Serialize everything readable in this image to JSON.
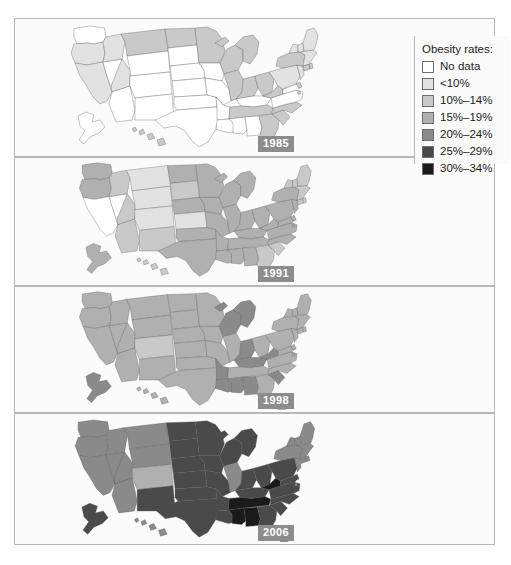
{
  "figure": {
    "kind": "choropleth-map-series"
  },
  "legend": {
    "title": "Obesity rates:",
    "entries": [
      {
        "label": "No data",
        "color": "#ffffff"
      },
      {
        "label": "<10%",
        "color": "#e2e2e2"
      },
      {
        "label": "10%–14%",
        "color": "#c9c9c9"
      },
      {
        "label": "15%–19%",
        "color": "#b0b0b0"
      },
      {
        "label": "20%–24%",
        "color": "#8a8a8a"
      },
      {
        "label": "25%–29%",
        "color": "#4a4a4a"
      },
      {
        "label": "30%–34%",
        "color": "#1a1a1a"
      }
    ]
  },
  "panels": [
    {
      "year": "1985"
    },
    {
      "year": "1991"
    },
    {
      "year": "1998"
    },
    {
      "year": "2006"
    }
  ],
  "chart_data": {
    "type": "heatmap",
    "title": "Obesity rates:",
    "xlabel": "",
    "ylabel": "",
    "legend_position": "right",
    "grid": false,
    "categories": [
      "No data",
      "<10%",
      "10%–14%",
      "15%–19%",
      "20%–24%",
      "25%–29%",
      "30%–34%"
    ],
    "category_colors": [
      "#ffffff",
      "#e2e2e2",
      "#c9c9c9",
      "#b0b0b0",
      "#8a8a8a",
      "#4a4a4a",
      "#1a1a1a"
    ],
    "series": [
      {
        "name": "1985",
        "values": {
          "AL": "No data",
          "AK": "No data",
          "AZ": "No data",
          "AR": "No data",
          "CA": "<10%",
          "CO": "No data",
          "CT": "10%–14%",
          "DE": "10%–14%",
          "DC": "10%–14%",
          "FL": "10%–14%",
          "GA": "10%–14%",
          "HI": "10%–14%",
          "ID": "<10%",
          "IL": "10%–14%",
          "IN": "10%–14%",
          "IA": "No data",
          "KS": "No data",
          "KY": "No data",
          "LA": "No data",
          "ME": "<10%",
          "MD": "No data",
          "MA": "<10%",
          "MI": "10%–14%",
          "MN": "10%–14%",
          "MS": "No data",
          "MO": "No data",
          "MT": "10%–14%",
          "NE": "No data",
          "NV": "No data",
          "NH": "<10%",
          "NJ": "<10%",
          "NM": "No data",
          "NY": "10%–14%",
          "NC": "10%–14%",
          "ND": "10%–14%",
          "OH": "10%–14%",
          "OK": "No data",
          "OR": "<10%",
          "PA": "<10%",
          "RI": "10%–14%",
          "SC": "10%–14%",
          "SD": "No data",
          "TN": "10%–14%",
          "TX": "No data",
          "UT": "<10%",
          "VT": "<10%",
          "VA": "No data",
          "WA": "No data",
          "WV": "10%–14%",
          "WI": "10%–14%",
          "WY": "No data"
        }
      },
      {
        "name": "1991",
        "values": {
          "AL": "15%–19%",
          "AK": "15%–19%",
          "AZ": "10%–14%",
          "AR": "15%–19%",
          "CA": "No data",
          "CO": "<10%",
          "CT": "10%–14%",
          "DE": "15%–19%",
          "DC": "15%–19%",
          "FL": "10%–14%",
          "GA": "10%–14%",
          "HI": "10%–14%",
          "ID": "10%–14%",
          "IL": "15%–19%",
          "IN": "15%–19%",
          "IA": "15%–19%",
          "KS": "<10%",
          "KY": "15%–19%",
          "LA": "15%–19%",
          "ME": "10%–14%",
          "MD": "15%–19%",
          "MA": "10%–14%",
          "MI": "15%–19%",
          "MN": "15%–19%",
          "MS": "15%–19%",
          "MO": "15%–19%",
          "MT": "<10%",
          "NE": "15%–19%",
          "NV": "No data",
          "NH": "10%–14%",
          "NJ": "15%–19%",
          "NM": "10%–14%",
          "NY": "15%–19%",
          "NC": "15%–19%",
          "ND": "15%–19%",
          "OH": "15%–19%",
          "OK": "15%–19%",
          "OR": "15%–19%",
          "PA": "15%–19%",
          "RI": "10%–14%",
          "SC": "10%–14%",
          "SD": "10%–14%",
          "TN": "15%–19%",
          "TX": "15%–19%",
          "UT": "10%–14%",
          "VT": "10%–14%",
          "VA": "15%–19%",
          "WA": "15%–19%",
          "WV": "15%–19%",
          "WI": "15%–19%",
          "WY": "<10%"
        }
      },
      {
        "name": "1998",
        "values": {
          "AL": "20%–24%",
          "AK": "20%–24%",
          "AZ": "15%–19%",
          "AR": "20%–24%",
          "CA": "15%–19%",
          "CO": "10%–14%",
          "CT": "15%–19%",
          "DE": "15%–19%",
          "DC": "15%–19%",
          "FL": "15%–19%",
          "GA": "15%–19%",
          "HI": "15%–19%",
          "ID": "15%–19%",
          "IL": "15%–19%",
          "IN": "20%–24%",
          "IA": "15%–19%",
          "KS": "15%–19%",
          "KY": "20%–24%",
          "LA": "20%–24%",
          "ME": "15%–19%",
          "MD": "15%–19%",
          "MA": "15%–19%",
          "MI": "20%–24%",
          "MN": "15%–19%",
          "MS": "20%–24%",
          "MO": "15%–19%",
          "MT": "15%–19%",
          "NE": "15%–19%",
          "NV": "15%–19%",
          "NH": "15%–19%",
          "NJ": "15%–19%",
          "NM": "15%–19%",
          "NY": "15%–19%",
          "NC": "15%–19%",
          "ND": "15%–19%",
          "OH": "15%–19%",
          "OK": "15%–19%",
          "OR": "15%–19%",
          "PA": "15%–19%",
          "RI": "15%–19%",
          "SC": "20%–24%",
          "SD": "15%–19%",
          "TN": "15%–19%",
          "TX": "15%–19%",
          "UT": "15%–19%",
          "VT": "15%–19%",
          "VA": "15%–19%",
          "WA": "15%–19%",
          "WV": "20%–24%",
          "WI": "20%–24%",
          "WY": "15%–19%"
        }
      },
      {
        "name": "2006",
        "values": {
          "AL": "30%–34%",
          "AK": "25%–29%",
          "AZ": "20%–24%",
          "AR": "25%–29%",
          "CA": "20%–24%",
          "CO": "15%–19%",
          "CT": "20%–24%",
          "DE": "25%–29%",
          "DC": "20%–24%",
          "FL": "20%–24%",
          "GA": "25%–29%",
          "HI": "20%–24%",
          "ID": "20%–24%",
          "IL": "20%–24%",
          "IN": "25%–29%",
          "IA": "25%–29%",
          "KS": "25%–29%",
          "KY": "25%–29%",
          "LA": "25%–29%",
          "ME": "20%–24%",
          "MD": "25%–29%",
          "MA": "20%–24%",
          "MI": "25%–29%",
          "MN": "25%–29%",
          "MS": "30%–34%",
          "MO": "25%–29%",
          "MT": "20%–24%",
          "NE": "25%–29%",
          "NV": "20%–24%",
          "NH": "20%–24%",
          "NJ": "20%–24%",
          "NM": "25%–29%",
          "NY": "20%–24%",
          "NC": "25%–29%",
          "ND": "25%–29%",
          "OH": "25%–29%",
          "OK": "25%–29%",
          "OR": "20%–24%",
          "PA": "25%–29%",
          "RI": "20%–24%",
          "SC": "25%–29%",
          "SD": "25%–29%",
          "TN": "30%–34%",
          "TX": "25%–29%",
          "UT": "20%–24%",
          "VT": "20%–24%",
          "VA": "25%–29%",
          "WA": "20%–24%",
          "WV": "30%–34%",
          "WI": "25%–29%",
          "WY": "20%–24%"
        }
      }
    ]
  }
}
